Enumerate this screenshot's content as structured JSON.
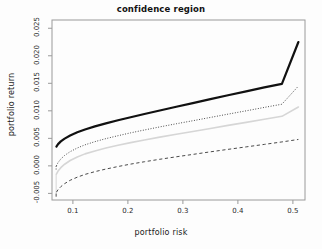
{
  "chart_data": {
    "type": "line",
    "title": "confidence region",
    "xlabel": "portfolio risk",
    "ylabel": "portfolio return",
    "xlim": [
      0.062,
      0.522
    ],
    "ylim": [
      -0.0062,
      0.0265
    ],
    "xticks": [
      0.1,
      0.2,
      0.3,
      0.4,
      0.5
    ],
    "xtick_labels": [
      "0.1",
      "0.2",
      "0.3",
      "0.4",
      "0.5"
    ],
    "yticks": [
      -0.005,
      0.0,
      0.005,
      0.01,
      0.015,
      0.02,
      0.025
    ],
    "ytick_labels": [
      "-0.005",
      "0.000",
      "0.005",
      "0.010",
      "0.015",
      "0.020",
      "0.025"
    ],
    "grid": false,
    "legend": "none",
    "box": true,
    "series": [
      {
        "name": "upper-confidence-bound",
        "style": "solid",
        "color": "#111111",
        "width": 2.2,
        "x": [
          0.07,
          0.073,
          0.078,
          0.085,
          0.095,
          0.108,
          0.122,
          0.14,
          0.16,
          0.182,
          0.205,
          0.23,
          0.258,
          0.288,
          0.318,
          0.35,
          0.382,
          0.415,
          0.448,
          0.48,
          0.51
        ],
        "y": [
          0.0035,
          0.00395,
          0.00445,
          0.00495,
          0.00552,
          0.0061,
          0.00662,
          0.00718,
          0.00772,
          0.00828,
          0.00884,
          0.00942,
          0.01006,
          0.01074,
          0.0114,
          0.01212,
          0.01282,
          0.01354,
          0.01425,
          0.0149,
          0.0225
        ]
      },
      {
        "name": "upper-dotted-bound",
        "style": "dotted",
        "color": "#3a3a3a",
        "width": 1.0,
        "x": [
          0.07,
          0.073,
          0.078,
          0.085,
          0.095,
          0.108,
          0.122,
          0.14,
          0.16,
          0.182,
          0.205,
          0.23,
          0.258,
          0.288,
          0.318,
          0.35,
          0.382,
          0.415,
          0.448,
          0.48,
          0.51
        ],
        "y": [
          0.0,
          0.0006,
          0.00125,
          0.0019,
          0.00258,
          0.00325,
          0.00382,
          0.0044,
          0.00495,
          0.00548,
          0.006,
          0.00652,
          0.00708,
          0.00765,
          0.0082,
          0.0088,
          0.0094,
          0.01,
          0.01062,
          0.0112,
          0.0145
        ]
      },
      {
        "name": "mean-efficient-frontier",
        "style": "solid",
        "color": "#d6d6d6",
        "width": 1.6,
        "x": [
          0.07,
          0.073,
          0.078,
          0.085,
          0.095,
          0.108,
          0.122,
          0.14,
          0.16,
          0.182,
          0.205,
          0.23,
          0.258,
          0.288,
          0.318,
          0.35,
          0.382,
          0.415,
          0.448,
          0.48,
          0.51
        ],
        "y": [
          -0.0015,
          -0.00095,
          -0.00032,
          0.0003,
          0.00098,
          0.00162,
          0.00218,
          0.00272,
          0.00324,
          0.00374,
          0.00422,
          0.0047,
          0.00522,
          0.00574,
          0.00625,
          0.0068,
          0.00735,
          0.0079,
          0.00846,
          0.009,
          0.0107
        ]
      },
      {
        "name": "lower-dashed-bound",
        "style": "dashed",
        "color": "#4a4a4a",
        "width": 1.0,
        "x": [
          0.07,
          0.073,
          0.078,
          0.085,
          0.095,
          0.108,
          0.122,
          0.14,
          0.16,
          0.182,
          0.205,
          0.23,
          0.258,
          0.288,
          0.318,
          0.35,
          0.382,
          0.415,
          0.448,
          0.48,
          0.51
        ],
        "y": [
          -0.0048,
          -0.00432,
          -0.00378,
          -0.00322,
          -0.00262,
          -0.00205,
          -0.00155,
          -0.00105,
          -0.00058,
          -0.00012,
          0.00032,
          0.00075,
          0.0012,
          0.00165,
          0.00208,
          0.00255,
          0.003,
          0.00345,
          0.0039,
          0.00435,
          0.0048
        ]
      }
    ],
    "left_vertical_markers": [
      {
        "name": "dotted-start-tail",
        "x": 0.0695,
        "y0": -0.00065,
        "y1": 0.0003,
        "color": "#3a3a3a",
        "style": "dotted"
      },
      {
        "name": "gray-start-tail",
        "x": 0.0695,
        "y0": -0.0048,
        "y1": -0.0015,
        "color": "#d6d6d6",
        "style": "solid"
      },
      {
        "name": "dashed-start-tail",
        "x": 0.0695,
        "y0": -0.0056,
        "y1": -0.0048,
        "color": "#4a4a4a",
        "style": "dashed"
      }
    ]
  }
}
